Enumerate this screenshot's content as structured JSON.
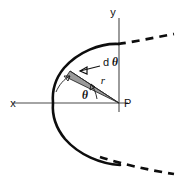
{
  "figure": {
    "background_color": "#ffffff",
    "curve_color": "#0d0d0d",
    "axis_color": "#4a4a4a",
    "wedge_fill_color": "#9a9a9a",
    "labels": {
      "y_axis": "y",
      "x_axis": "x",
      "focus_point": "P",
      "radius": "r",
      "angle": "θ",
      "differential_angle_d": "d",
      "differential_angle_theta": "θ"
    },
    "icons": {
      "dtheta_leader": "leader-arrow-icon",
      "angle_sweep": "curved-arrow-icon",
      "wedge_pointer": "curved-arrow-icon"
    },
    "geometry": {
      "focus_x": 119,
      "focus_y": 103,
      "vertex_x": 53,
      "vertex_y": 103,
      "y_axis_x": 119,
      "x_axis_y": 103,
      "angle_theta_deg": 40,
      "wedge_dtheta_deg": 9
    }
  }
}
